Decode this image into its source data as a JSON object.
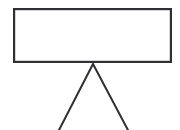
{
  "figure": {
    "title": "",
    "background_color": "#ffffff",
    "stroke_color": "#2f3033",
    "canvas": {
      "width": 180,
      "height": 130
    },
    "shapes": {
      "panel": {
        "label": "",
        "type": "rectangle",
        "x": 13,
        "y": 8,
        "width": 159,
        "height": 55,
        "fill": "#ffffff",
        "stroke_width": 2.2
      },
      "stand": {
        "label": "",
        "type": "polyline",
        "points": "58,132 93,64 129,132",
        "apex_x": 93,
        "apex_y": 64,
        "left_foot_x": 58,
        "right_foot_x": 129,
        "stroke_width": 2.0
      }
    }
  }
}
